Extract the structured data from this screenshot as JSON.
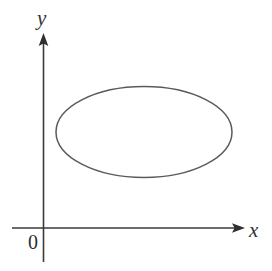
{
  "figure": {
    "kind": "coordinate-plane-with-ellipse",
    "background_color": "#ffffff",
    "width": 272,
    "height": 271
  },
  "axes": {
    "origin_label": "0",
    "x_axis": {
      "label": "x",
      "arrow": "right-arrowhead",
      "color": "#3a3a3a",
      "y_position": 228,
      "x_start": 12,
      "x_end": 245
    },
    "y_axis": {
      "label": "y",
      "arrow": "up-arrowhead",
      "color": "#3a3a3a",
      "x_position": 43.5,
      "y_start": 33,
      "y_end": 262
    }
  },
  "chart_data": {
    "type": "scatter",
    "title": "",
    "xlabel": "x",
    "ylabel": "y",
    "grid": false,
    "legend": null,
    "annotations": [
      "0"
    ],
    "shapes": [
      {
        "name": "ellipse",
        "center_x": 144,
        "center_y": 132,
        "semi_axis_x": 88,
        "semi_axis_y": 45.5,
        "stroke_color": "#5a5a5a",
        "stroke_width": 1.5,
        "fill": "none"
      }
    ]
  }
}
